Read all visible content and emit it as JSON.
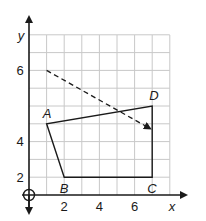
{
  "diagram": {
    "type": "coordinate-grid",
    "axes": {
      "x_label": "x",
      "y_label": "y",
      "x_ticks": [
        "2",
        "4",
        "6"
      ],
      "y_ticks": [
        "2",
        "4",
        "6"
      ],
      "x_range": [
        0,
        8
      ],
      "y_range": [
        0,
        9
      ]
    },
    "polygon": {
      "vertices": [
        {
          "label": "A",
          "x": 1,
          "y": 4
        },
        {
          "label": "B",
          "x": 2,
          "y": 1
        },
        {
          "label": "C",
          "x": 7,
          "y": 1
        },
        {
          "label": "D",
          "x": 7,
          "y": 5
        }
      ]
    },
    "translation_arrow": {
      "style": "dashed",
      "from": {
        "x": 1,
        "y": 7
      },
      "to": {
        "x": 7,
        "y": 3
      }
    },
    "colors": {
      "grid": "#c8c8c8",
      "axis": "#1a1a1a",
      "shape": "#1a1a1a"
    }
  }
}
